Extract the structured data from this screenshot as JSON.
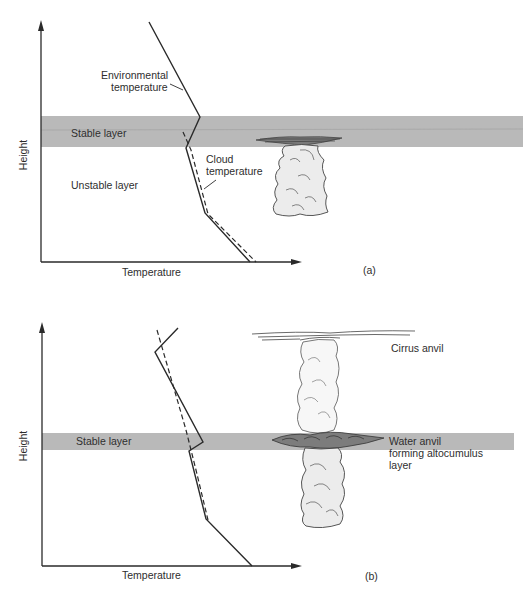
{
  "panels": [
    {
      "id": "a",
      "caption": "(a)",
      "y_axis_label": "Height",
      "x_axis_label": "Temperature",
      "labels": {
        "environmental_1": "Environmental",
        "environmental_2": "temperature",
        "stable_layer": "Stable layer",
        "unstable_layer": "Unstable layer",
        "cloud_1": "Cloud",
        "cloud_2": "temperature"
      }
    },
    {
      "id": "b",
      "caption": "(b)",
      "y_axis_label": "Height",
      "x_axis_label": "Temperature",
      "labels": {
        "stable_layer": "Stable layer",
        "cirrus_anvil": "Cirrus anvil",
        "water_anvil_1": "Water anvil",
        "water_anvil_2": "forming altocumulus",
        "water_anvil_3": "layer"
      }
    }
  ],
  "colors": {
    "stable_band": "#b9b9b9",
    "line": "#2a2a2a",
    "cloud_fill": "#ececec",
    "cloud_outline": "#444444",
    "anvil_dark": "#6a6a6a"
  }
}
